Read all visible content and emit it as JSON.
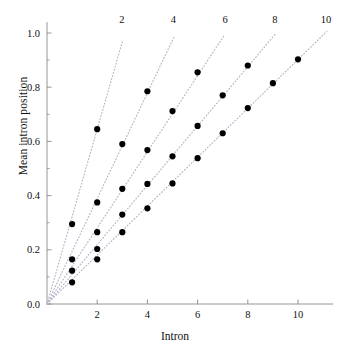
{
  "chart_data": {
    "type": "scatter",
    "title": "",
    "xlabel": "Intron",
    "ylabel": "Mean intron position",
    "xlim": [
      0,
      11.4
    ],
    "ylim": [
      0,
      1.04
    ],
    "grid": false,
    "legend_position": "top-inline-line-labels",
    "xticks": [
      2,
      4,
      6,
      8,
      10
    ],
    "xtick_labels": [
      "2",
      "4",
      "6",
      "8",
      "10"
    ],
    "yticks": [
      0.0,
      0.2,
      0.4,
      0.6,
      0.8,
      1.0
    ],
    "ytick_labels": [
      "0.0",
      "0.2",
      "0.4",
      "0.6",
      "0.8",
      "1.0"
    ],
    "yminorticks": [
      0.1,
      0.3,
      0.5,
      0.7,
      0.9
    ],
    "marker": "filled-circle",
    "marker_color": "#000000",
    "marker_size_px": 5.0,
    "line_style": "dotted",
    "line_color": "#b9b3c9",
    "axis_color": "#8a8a8a",
    "series": [
      {
        "name": "2",
        "label": "2",
        "label_x": 2.98,
        "label_y": 1.04,
        "slope": 0.3225,
        "line_from": [
          0,
          0
        ],
        "line_to": [
          3.0,
          0.9675
        ],
        "x": [
          1,
          2
        ],
        "y": [
          0.295,
          0.645
        ]
      },
      {
        "name": "4",
        "label": "4",
        "label_x": 5.03,
        "label_y": 1.04,
        "slope": 0.1947,
        "line_from": [
          0,
          0
        ],
        "line_to": [
          5.05,
          0.983
        ],
        "x": [
          1,
          2,
          3,
          4
        ],
        "y": [
          0.165,
          0.375,
          0.59,
          0.785
        ]
      },
      {
        "name": "6",
        "label": "6",
        "label_x": 7.1,
        "label_y": 1.04,
        "slope": 0.1405,
        "line_from": [
          0,
          0
        ],
        "line_to": [
          7.05,
          0.99
        ],
        "x": [
          1,
          2,
          3,
          4,
          5,
          6
        ],
        "y": [
          0.123,
          0.265,
          0.425,
          0.568,
          0.712,
          0.855
        ]
      },
      {
        "name": "8",
        "label": "8",
        "label_x": 9.08,
        "label_y": 1.04,
        "slope": 0.1094,
        "line_from": [
          0,
          0
        ],
        "line_to": [
          9.1,
          0.996
        ],
        "x": [
          1,
          2,
          3,
          4,
          5,
          6,
          7,
          8
        ],
        "y": [
          0.08,
          0.203,
          0.33,
          0.443,
          0.545,
          0.657,
          0.77,
          0.88
        ]
      },
      {
        "name": "10",
        "label": "10",
        "label_x": 11.12,
        "label_y": 1.04,
        "slope": 0.0902,
        "line_from": [
          0,
          0
        ],
        "line_to": [
          11.15,
          1.006
        ],
        "x": [
          2,
          3,
          4,
          5,
          6,
          7,
          8,
          9,
          10
        ],
        "y": [
          0.165,
          0.265,
          0.353,
          0.445,
          0.538,
          0.63,
          0.723,
          0.815,
          0.903
        ]
      }
    ]
  }
}
